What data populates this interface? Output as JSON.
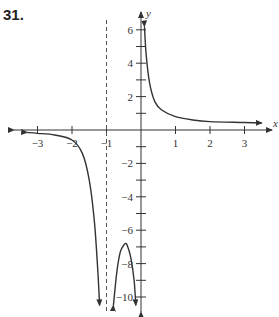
{
  "problem": {
    "number": "31."
  },
  "chart_data": {
    "type": "line",
    "title": "",
    "xlabel": "x",
    "ylabel": "y",
    "xlim": [
      -3.6,
      3.8
    ],
    "ylim": [
      -11,
      6.8
    ],
    "x_ticks": [
      -3,
      -2,
      -1,
      1,
      2,
      3
    ],
    "x_tick_labels": [
      "-3",
      "-2",
      "-1",
      "1",
      "2",
      "3"
    ],
    "y_ticks": [
      -10,
      -9,
      -8,
      -7,
      -6,
      -5,
      -4,
      -3,
      -2,
      -1,
      1,
      2,
      3,
      4,
      5,
      6
    ],
    "y_tick_labels": [
      "-10",
      "-8",
      "-6",
      "-4",
      "-2",
      "2",
      "4",
      "6"
    ],
    "grid": false,
    "asymptotes": [
      {
        "type": "vertical",
        "x": -1,
        "style": "dashed"
      },
      {
        "type": "vertical",
        "x": 0,
        "style": "coincides with y-axis"
      }
    ],
    "series": [
      {
        "name": "left-branch",
        "x": [
          -3.3,
          -3.0,
          -2.5,
          -2.0,
          -1.7,
          -1.5,
          -1.35,
          -1.25,
          -1.2
        ],
        "y": [
          -0.15,
          -0.2,
          -0.3,
          -0.6,
          -1.4,
          -3.0,
          -5.5,
          -8.5,
          -10.5
        ]
      },
      {
        "name": "middle-branch",
        "x": [
          -0.8,
          -0.7,
          -0.6,
          -0.5,
          -0.45,
          -0.4,
          -0.3,
          -0.2,
          -0.15
        ],
        "y": [
          -10.5,
          -8.5,
          -7.3,
          -6.9,
          -6.8,
          -6.9,
          -7.6,
          -9.0,
          -10.5
        ]
      },
      {
        "name": "right-branch",
        "x": [
          0.1,
          0.15,
          0.25,
          0.4,
          0.6,
          1.0,
          1.5,
          2.0,
          3.0,
          3.5
        ],
        "y": [
          6.2,
          4.5,
          2.8,
          1.7,
          1.2,
          0.8,
          0.6,
          0.5,
          0.45,
          0.42
        ]
      }
    ]
  }
}
